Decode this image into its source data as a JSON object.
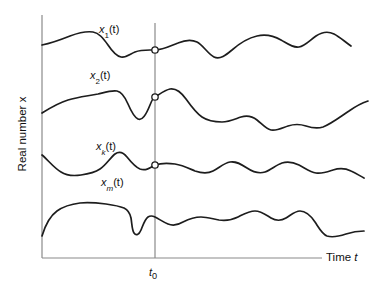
{
  "figure": {
    "background_color": "#ffffff",
    "axis_color": "#8a8a8a",
    "curve_color": "#1d1d1d"
  },
  "axes": {
    "ylabel": "Real number x",
    "xlabel_prefix": "Time ",
    "xlabel_symbol": "t",
    "y_axis_x": 42,
    "y_axis_top": 15,
    "x_axis_y": 258,
    "x_axis_right": 322
  },
  "marker": {
    "label_prefix": "t",
    "label_subscript": "0",
    "x": 155,
    "top": 23,
    "bottom": 258
  },
  "curves": [
    {
      "name": "x1",
      "label_symbol": "x",
      "label_subscript": "1",
      "label_suffix": "(t)",
      "crossing_y": 50,
      "has_crossing_dot": true,
      "path": "M 42,45 C 52,43 60,40 70,36 C 78,33 86,31 93,32 C 99,33 103,38 108,45 C 112,51 116,56 121,57 C 126,58 130,54 135,52 C 140,50 145,50 150,50 L 155,50 C 163,50 170,46 178,43 C 185,40 191,39 197,42 C 203,45 208,54 214,57 C 220,60 226,55 232,50 C 240,43 248,38 257,36 C 266,34 274,36 281,40 C 288,44 293,48 299,47 C 305,46 310,40 316,36 C 322,32 328,31 334,34 C 340,37 345,42 351,46"
    },
    {
      "name": "x2",
      "label_symbol": "x",
      "label_subscript": "2",
      "label_suffix": "(t)",
      "crossing_y": 97,
      "has_crossing_dot": true,
      "path": "M 42,113 C 50,108 58,103 68,100 C 78,97 88,96 98,94 C 106,92 112,90 117,91 C 122,92 125,97 128,104 C 131,111 134,117 138,119 C 142,121 146,115 150,105 C 152,100 154,97 155,97 C 160,94 165,90 170,89 C 176,88 181,92 186,99 C 191,106 196,113 202,117 C 208,121 215,122 222,122 C 229,122 235,119 241,117 C 247,115 252,116 257,120 C 262,124 266,129 271,130 C 277,131 282,128 288,126 C 294,124 300,124 306,126 C 312,128 317,129 323,127 C 331,124 340,117 349,111 C 356,106 362,103 368,101"
    },
    {
      "name": "xk",
      "label_symbol": "x",
      "label_subscript": "k",
      "label_suffix": "(t)",
      "crossing_y": 165,
      "has_crossing_dot": true,
      "path": "M 42,155 C 48,160 54,168 61,172 C 67,176 74,176 81,175 C 88,174 94,173 100,169 C 106,165 110,158 115,154 C 119,151 123,152 127,157 C 131,162 135,167 140,169 C 146,171 150,168 155,165 C 161,163 168,163 175,164 C 182,165 188,168 195,171 C 201,173 207,174 213,171 C 219,168 224,163 230,162 C 236,161 241,164 247,168 C 253,172 259,174 265,172 C 271,170 276,165 282,163 C 288,161 293,162 299,165 C 305,168 310,172 316,173 C 322,174 327,172 333,170 C 339,168 345,168 351,171 C 356,173 360,176 364,178"
    },
    {
      "name": "xm",
      "label_symbol": "x",
      "label_subscript": "m",
      "label_suffix": "(t)",
      "crossing_y": 216,
      "has_crossing_dot": false,
      "path": "M 42,236 C 45,226 50,216 57,211 C 64,206 72,204 80,203 C 89,202 98,203 106,204 C 113,205 119,206 124,208 C 128,210 130,213 131,218 C 132,224 132,230 134,233 C 136,236 139,235 141,230 C 143,225 145,219 148,217 C 151,215 153,216 155,217 C 159,219 163,222 168,224 C 173,226 178,225 183,222 C 189,219 195,217 201,217 C 207,217 213,219 219,220 C 226,221 232,220 238,217 C 244,214 249,211 255,211 C 261,211 266,215 271,218 C 276,221 281,221 286,218 C 291,215 295,211 300,211 C 306,211 311,216 315,222 C 319,228 322,234 327,236 C 333,238 340,236 346,234 C 352,232 358,231 364,231"
    }
  ]
}
